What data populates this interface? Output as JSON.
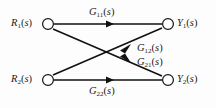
{
  "diagram": {
    "type": "signal-flow-graph",
    "background_color": "#fdfdfd",
    "line_color": "#111111",
    "node_fill_color": "#ffffff",
    "nodes": [
      {
        "id": "r1",
        "label_base": "R",
        "label_sub": "1",
        "label_arg": "(s)",
        "label_text": "R1(s)",
        "role": "input",
        "x": 48,
        "y": 24
      },
      {
        "id": "r2",
        "label_base": "R",
        "label_sub": "2",
        "label_arg": "(s)",
        "label_text": "R2(s)",
        "role": "input",
        "x": 48,
        "y": 80
      },
      {
        "id": "y1",
        "label_base": "Y",
        "label_sub": "1",
        "label_arg": "(s)",
        "label_text": "Y1(s)",
        "role": "output",
        "x": 168,
        "y": 24
      },
      {
        "id": "y2",
        "label_base": "Y",
        "label_sub": "2",
        "label_arg": "(s)",
        "label_text": "Y2(s)",
        "role": "output",
        "x": 168,
        "y": 80
      }
    ],
    "edges": [
      {
        "id": "g11",
        "from": "r1",
        "to": "y1",
        "label_base": "G",
        "label_sub": "11",
        "label_arg": "(s)",
        "label_text": "G11(s)",
        "arrow_x": 112,
        "arrow_y": 24
      },
      {
        "id": "g21",
        "from": "r1",
        "to": "y2",
        "label_base": "G",
        "label_sub": "21",
        "label_arg": "(s)",
        "label_text": "G21(s)",
        "arrow_x": 132,
        "arrow_y": 61
      },
      {
        "id": "g12",
        "from": "r2",
        "to": "y1",
        "label_base": "G",
        "label_sub": "12",
        "label_arg": "(s)",
        "label_text": "G12(s)",
        "arrow_x": 132,
        "arrow_y": 45
      },
      {
        "id": "g22",
        "from": "r2",
        "to": "y2",
        "label_base": "G",
        "label_sub": "22",
        "label_arg": "(s)",
        "label_text": "G22(s)",
        "arrow_x": 112,
        "arrow_y": 80
      }
    ]
  }
}
